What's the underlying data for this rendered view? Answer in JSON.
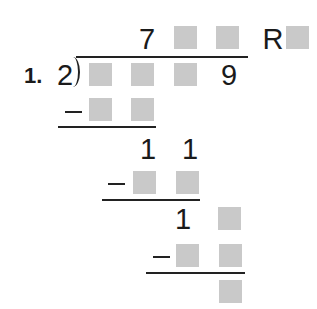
{
  "problem": {
    "number_label": "1.",
    "divisor": "2",
    "quotient": {
      "digits": [
        "7",
        "",
        ""
      ],
      "remainder_label": "R",
      "remainder": ""
    },
    "dividend": {
      "digits": [
        "",
        "",
        "",
        "9"
      ]
    },
    "steps": [
      {
        "subtract": [
          "",
          ""
        ]
      },
      {
        "difference": [
          "1",
          "1"
        ],
        "subtract": [
          "",
          ""
        ]
      },
      {
        "difference": [
          "1",
          ""
        ],
        "subtract": [
          "",
          ""
        ]
      },
      {
        "final_remainder": [
          ""
        ]
      }
    ]
  },
  "colors": {
    "box_fill": "#c9c9c9",
    "ink": "#1a1a1a",
    "background": "#ffffff"
  }
}
